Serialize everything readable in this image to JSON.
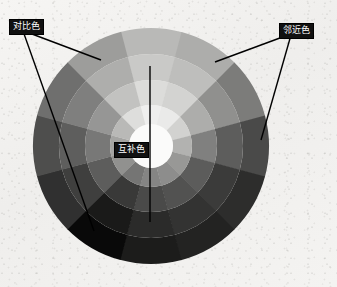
{
  "figure": {
    "background_color": "#f3f2f0",
    "width": 337,
    "height": 287
  },
  "annotations": [
    {
      "id": "contrast",
      "label": "对比色",
      "meaning": "contrasting-colors",
      "label_position": {
        "x": 9,
        "y": 19
      },
      "leader_lines": [
        {
          "from": {
            "x": 24,
            "y": 31
          },
          "to": {
            "x": 101,
            "y": 60
          }
        },
        {
          "from": {
            "x": 23,
            "y": 31
          },
          "to": {
            "x": 94,
            "y": 231
          }
        }
      ]
    },
    {
      "id": "adjacent",
      "label": "邻近色",
      "meaning": "adjacent-analogous-colors",
      "label_position": {
        "x": 279,
        "y": 23
      },
      "leader_lines": [
        {
          "from": {
            "x": 288,
            "y": 35
          },
          "to": {
            "x": 215,
            "y": 62
          }
        },
        {
          "from": {
            "x": 291,
            "y": 35
          },
          "to": {
            "x": 261,
            "y": 140
          }
        }
      ]
    },
    {
      "id": "complement",
      "label": "互补色",
      "meaning": "complementary-colors",
      "label_position": {
        "x": 114,
        "y": 142
      },
      "leader_lines": [
        {
          "from": {
            "x": 150,
            "y": 66
          },
          "to": {
            "x": 150,
            "y": 222
          }
        }
      ]
    }
  ],
  "chart_data": {
    "type": "pie",
    "subtype": "polar-grayscale-color-wheel",
    "title": "",
    "center": {
      "x": 151,
      "y": 146
    },
    "outer_radius": 118,
    "ring_count": 4,
    "sector_count": 12,
    "start_angle_deg": -105,
    "sector_span_deg": 30,
    "ring_radii": [
      118,
      92,
      66,
      41
    ],
    "inner_core_radius": 22,
    "inner_core_color": "#fbfbfa",
    "sector_labels": [
      "sector-1",
      "sector-2",
      "sector-3",
      "sector-4",
      "sector-5",
      "sector-6",
      "sector-7",
      "sector-8",
      "sector-9",
      "sector-10",
      "sector-11",
      "sector-12"
    ],
    "legend_position": "none",
    "grid": false,
    "rings": [
      {
        "name": "outer-ring",
        "radius_outer": 118,
        "radius_inner": 92,
        "values": [
          "#b9b9b7",
          "#adadab",
          "#7c7c7a",
          "#4a4a49",
          "#2d2d2c",
          "#232322",
          "#1c1c1b",
          "#090909",
          "#303030",
          "#4e4e4d",
          "#6f6f6e",
          "#9d9d9b"
        ]
      },
      {
        "name": "second-ring",
        "radius_outer": 92,
        "radius_inner": 66,
        "values": [
          "#c9c9c7",
          "#bebebc",
          "#90908e",
          "#5d5d5c",
          "#3b3b3a",
          "#333332",
          "#2b2b2a",
          "#1a1a19",
          "#3f3f3e",
          "#5e5e5d",
          "#7f7f7e",
          "#aeaeac"
        ]
      },
      {
        "name": "third-ring",
        "radius_outer": 66,
        "radius_inner": 41,
        "values": [
          "#dcdcda",
          "#d3d3d1",
          "#adadab",
          "#80807f",
          "#5c5c5b",
          "#525251",
          "#4a4a49",
          "#393938",
          "#5d5d5c",
          "#787877",
          "#969695",
          "#c2c2c0"
        ]
      },
      {
        "name": "inner-ring",
        "radius_outer": 41,
        "radius_inner": 22,
        "values": [
          "#efefee",
          "#eaeae9",
          "#d2d2d0",
          "#b2b2b0",
          "#989896",
          "#8d8d8c",
          "#858584",
          "#757574",
          "#91918f",
          "#a4a4a2",
          "#b9b9b7",
          "#dedeDC"
        ]
      }
    ]
  }
}
